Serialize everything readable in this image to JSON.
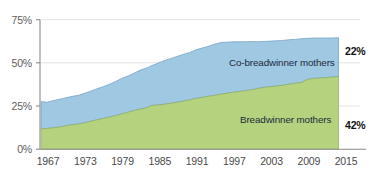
{
  "chart_data": {
    "type": "area",
    "stacked": true,
    "title": "",
    "subtitle": "",
    "xlabel": "",
    "ylabel": "",
    "ylim": [
      0,
      75
    ],
    "xlim": [
      1967,
      2015
    ],
    "grid": true,
    "legend_position": "inline-on-series",
    "ytick_labels": [
      "0%",
      "25%",
      "50%",
      "75%"
    ],
    "ytick_values": [
      0,
      25,
      50,
      75
    ],
    "xtick_labels": [
      "1967",
      "1973",
      "1979",
      "1985",
      "1991",
      "1997",
      "2003",
      "2009",
      "2015"
    ],
    "xtick_values": [
      1967,
      1973,
      1979,
      1985,
      1991,
      1997,
      2003,
      2009,
      2015
    ],
    "x": [
      1967,
      1968,
      1969,
      1970,
      1971,
      1972,
      1973,
      1974,
      1975,
      1976,
      1977,
      1978,
      1979,
      1980,
      1981,
      1982,
      1983,
      1984,
      1985,
      1986,
      1987,
      1988,
      1989,
      1990,
      1991,
      1992,
      1993,
      1994,
      1995,
      1996,
      1997,
      1998,
      1999,
      2000,
      2001,
      2002,
      2003,
      2004,
      2005,
      2006,
      2007,
      2008,
      2009,
      2010,
      2011,
      2012,
      2013,
      2014,
      2015
    ],
    "series": [
      {
        "name": "Breadwinner mothers",
        "color": "#b5d37f",
        "stroke": "#8faf5c",
        "label": "Breadwinner mothers",
        "end_value_label": "42%",
        "values": [
          11.8,
          12.0,
          12.4,
          12.8,
          13.6,
          14.2,
          14.6,
          15.2,
          16.1,
          17.0,
          17.8,
          18.6,
          19.4,
          20.4,
          21.4,
          22.4,
          23.2,
          24.0,
          25.4,
          25.6,
          26.1,
          26.6,
          27.2,
          27.8,
          28.6,
          29.4,
          30.0,
          30.6,
          31.2,
          31.8,
          32.4,
          33.0,
          33.4,
          33.9,
          34.4,
          35.2,
          35.8,
          36.2,
          36.6,
          37.0,
          37.6,
          38.2,
          38.6,
          40.4,
          41.0,
          41.2,
          41.4,
          41.8,
          42.0
        ]
      },
      {
        "name": "Co-breadwinner mothers",
        "color": "#9fc8e3",
        "stroke": "#6d9cc0",
        "label": "Co-breadwinner mothers",
        "end_value_label": "22%",
        "values": [
          15.8,
          15.2,
          15.8,
          16.2,
          16.2,
          16.4,
          16.6,
          17.2,
          17.5,
          18.0,
          18.4,
          19.0,
          19.8,
          20.6,
          21.0,
          21.6,
          22.6,
          23.0,
          23.2,
          24.4,
          25.4,
          26.0,
          26.6,
          27.2,
          27.4,
          28.2,
          28.6,
          29.0,
          29.6,
          30.0,
          29.6,
          29.2,
          28.8,
          28.4,
          28.0,
          27.0,
          26.6,
          26.4,
          26.2,
          26.0,
          25.8,
          25.4,
          25.4,
          23.8,
          23.4,
          23.2,
          23.0,
          22.6,
          22.6
        ]
      }
    ],
    "stacked_totals": [
      27.6,
      27.2,
      28.2,
      29.0,
      29.8,
      30.6,
      31.2,
      32.4,
      33.6,
      35.0,
      36.2,
      37.6,
      39.2,
      41.0,
      42.4,
      44.0,
      45.8,
      47.0,
      48.6,
      50.0,
      51.5,
      52.6,
      53.8,
      55.0,
      56.0,
      57.6,
      58.6,
      59.6,
      60.8,
      61.8,
      62.0,
      62.2,
      62.2,
      62.3,
      62.4,
      62.2,
      62.4,
      62.6,
      62.8,
      63.0,
      63.4,
      63.6,
      64.0,
      64.2,
      64.4,
      64.4,
      64.4,
      64.4,
      64.6
    ],
    "annotations": [
      {
        "name": "co-breadwinner-end",
        "text": "22%",
        "series": "Co-breadwinner mothers"
      },
      {
        "name": "breadwinner-end",
        "text": "42%",
        "series": "Breadwinner mothers"
      }
    ]
  },
  "colors": {
    "breadwinner_fill": "#b5d37f",
    "co_breadwinner_fill": "#9fc8e3",
    "axis": "#8a8a8a",
    "grid": "#e2e2e2",
    "tick_text": "#5d5d5d",
    "background": "#ffffff"
  }
}
